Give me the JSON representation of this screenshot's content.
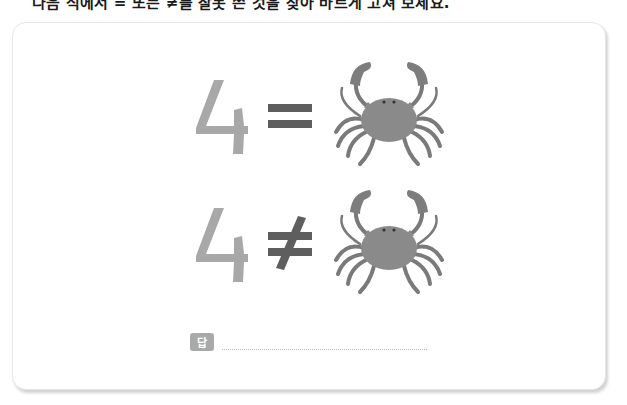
{
  "instruction": {
    "text": "다음 식에서 = 또는 ≠를 잘못 쓴 것을 찾아 바르게 고쳐 보세요."
  },
  "problem": {
    "rows": [
      {
        "number": "4",
        "symbol": "=",
        "symbol_name": "equals",
        "image": "crab-icon"
      },
      {
        "number": "4",
        "symbol": "≠",
        "symbol_name": "not-equals",
        "image": "crab-icon"
      }
    ]
  },
  "answer": {
    "label": "답",
    "value": ""
  },
  "colors": {
    "digit": "#a8a8a8",
    "symbol": "#5e5e5e",
    "crab_body": "#8a8a8a",
    "crab_dark": "#6a6a6a",
    "answer_label_bg": "#a9a9a9",
    "card_border": "#e6e6e6"
  }
}
